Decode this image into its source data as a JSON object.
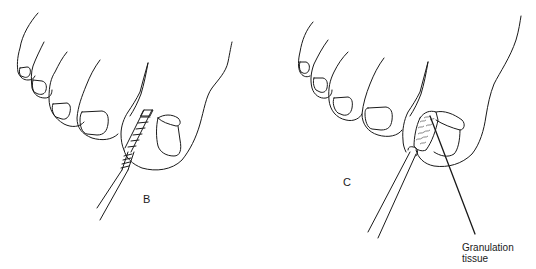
{
  "figure": {
    "panels": [
      {
        "id": "B",
        "label": "B",
        "depicts": "toe with cotton-wrapped applicator inserted under nail edge"
      },
      {
        "id": "C",
        "label": "C",
        "depicts": "toe with swab applied to granulation tissue at nail fold"
      }
    ],
    "annotations": [
      {
        "panel": "C",
        "text_line1": "Granulation",
        "text_line2": "tissue"
      }
    ],
    "colors": {
      "line": "#1a1a1a",
      "background": "#ffffff"
    }
  }
}
